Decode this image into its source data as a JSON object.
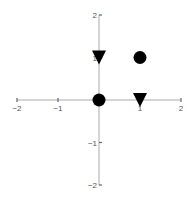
{
  "chart_data": {
    "type": "scatter",
    "title": "",
    "xlabel": "",
    "ylabel": "",
    "xlim": [
      -2,
      2
    ],
    "ylim": [
      -2,
      2
    ],
    "grid": false,
    "legend": null,
    "x_ticks": [
      -2,
      -1,
      1,
      2
    ],
    "y_ticks": [
      -2,
      -1,
      1,
      2
    ],
    "x_tick_labels": [
      "−2",
      "−1",
      "1",
      "2"
    ],
    "y_tick_labels": [
      "−2",
      "−1",
      "1",
      "2"
    ],
    "series": [
      {
        "name": "circles",
        "marker": "circle",
        "color": "#000000",
        "points": [
          [
            0,
            0
          ],
          [
            1,
            1
          ]
        ]
      },
      {
        "name": "triangles",
        "marker": "triangle-down",
        "color": "#000000",
        "points": [
          [
            0,
            1
          ],
          [
            1,
            0
          ]
        ]
      }
    ]
  }
}
